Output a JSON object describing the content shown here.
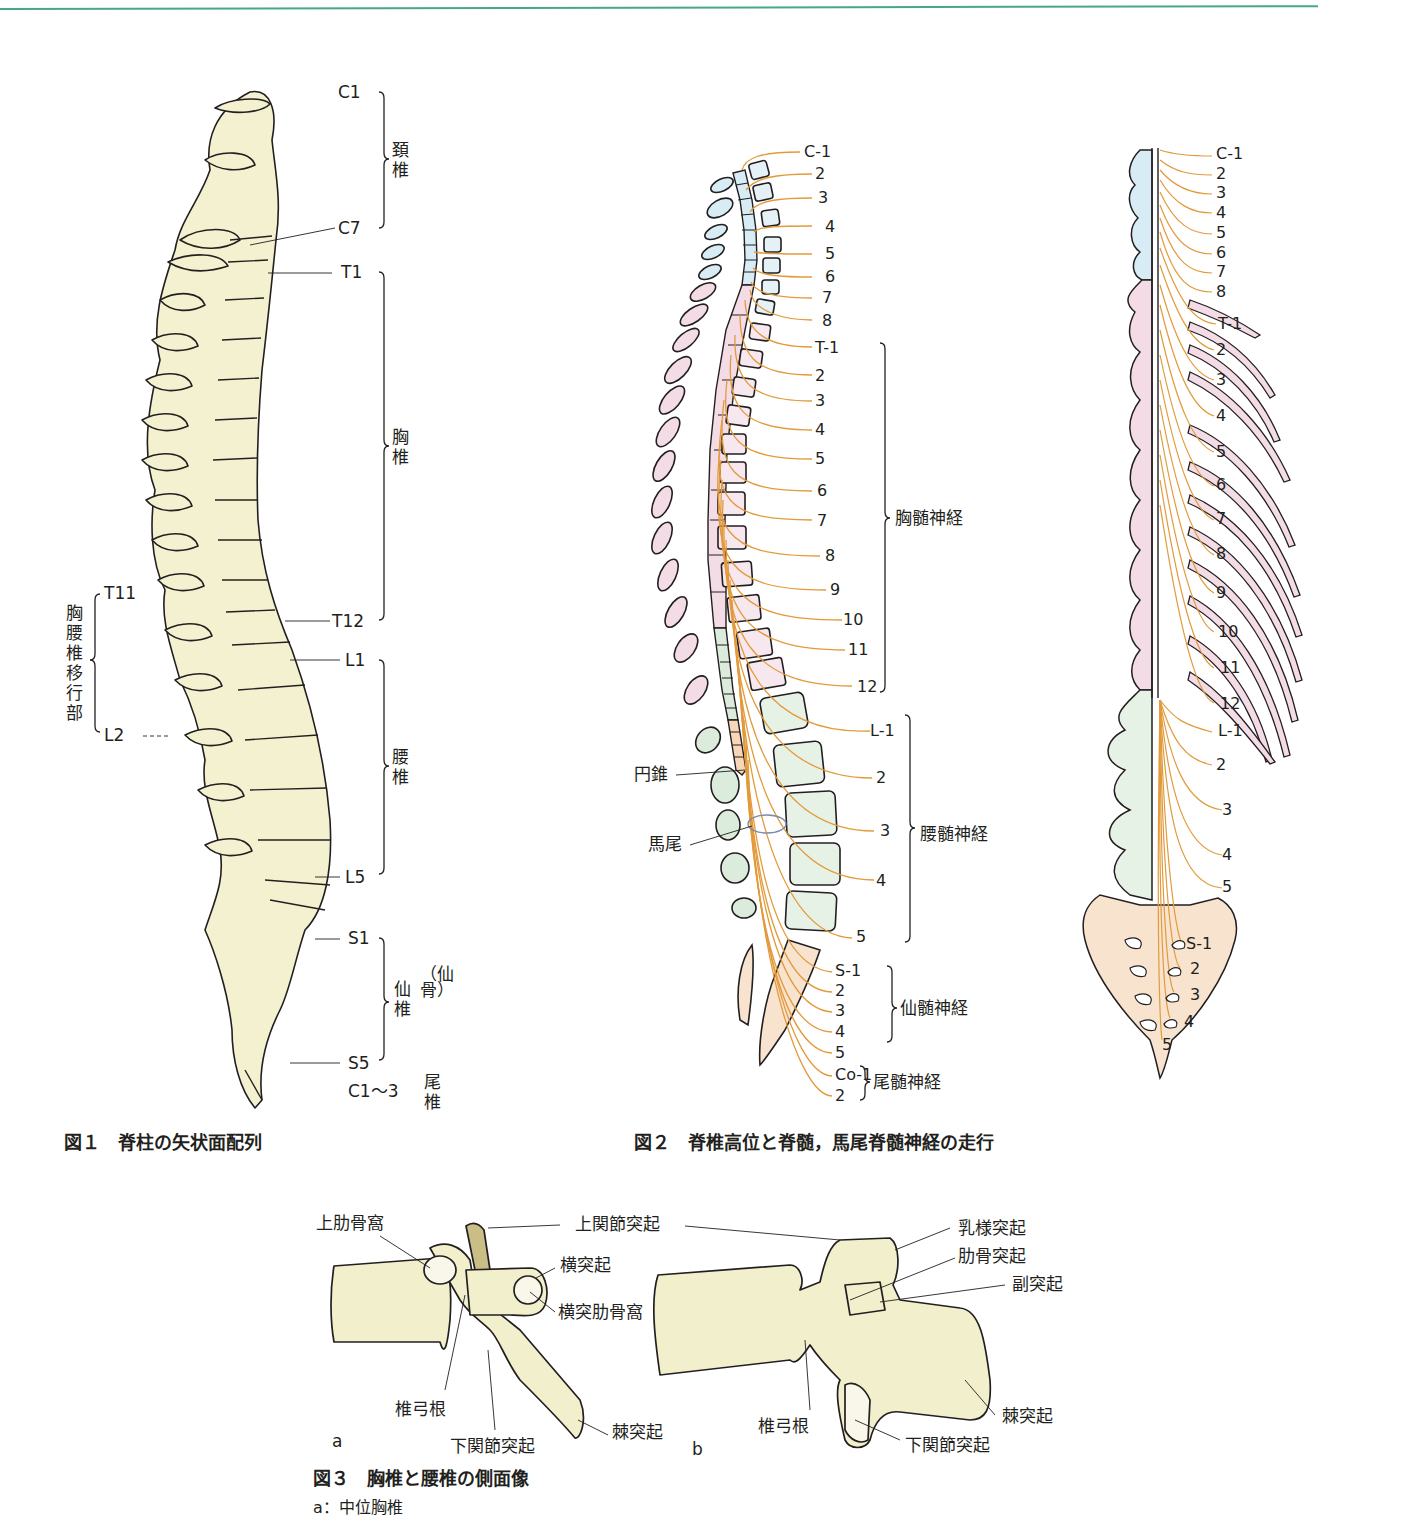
{
  "colors": {
    "bone_fill": "#f3f1cf",
    "cervical": "#d7ecf5",
    "thoracic": "#f3dce6",
    "lumbar": "#dcecdc",
    "sacral": "#f8e3cf",
    "nerve": "#e39a3b",
    "top_rule": "#4aa783"
  },
  "fig1": {
    "caption": "図１　脊柱の矢状面配列",
    "labels": {
      "c1": "C1",
      "c7": "C7",
      "t1": "T1",
      "t12": "T12",
      "l1": "L1",
      "l5": "L5",
      "s1": "S1",
      "s5": "S5",
      "coccyx": "C1～3",
      "t11": "T11",
      "l2": "L2"
    },
    "regions": {
      "cervical": "頚椎",
      "thoracic": "胸椎",
      "lumbar": "腰椎",
      "sacral": "仙椎",
      "sacrum": "（仙骨）",
      "coccygeal": "尾椎",
      "transition": "胸腰椎移行部"
    }
  },
  "fig2": {
    "caption": "図２　脊椎高位と脊髄，馬尾脊髄神経の走行",
    "cervical_nerves": [
      "C-1",
      "2",
      "3",
      "4",
      "5",
      "6",
      "7",
      "8"
    ],
    "thoracic_nerves": [
      "T-1",
      "2",
      "3",
      "4",
      "5",
      "6",
      "7",
      "8",
      "9",
      "10",
      "11",
      "12"
    ],
    "lumbar_nerves": [
      "L-1",
      "2",
      "3",
      "4",
      "5"
    ],
    "sacral_nerves": [
      "S-1",
      "2",
      "3",
      "4",
      "5"
    ],
    "coccygeal_nerves": [
      "Co-1",
      "2"
    ],
    "groups": {
      "thoracic": "胸髄神経",
      "lumbar": "腰髄神経",
      "sacral": "仙髄神経",
      "coccygeal": "尾髄神経"
    },
    "annotations": {
      "conus": "円錐",
      "cauda": "馬尾"
    },
    "posterior_view": {
      "cervical": [
        "C-1",
        "2",
        "3",
        "4",
        "5",
        "6",
        "7",
        "8"
      ],
      "thoracic": [
        "T-1",
        "2",
        "3",
        "4",
        "5",
        "6",
        "7",
        "8",
        "9",
        "10",
        "11",
        "12"
      ],
      "lumbar": [
        "L-1",
        "2",
        "3",
        "4",
        "5"
      ],
      "sacral": [
        "S-1",
        "2",
        "3",
        "4",
        "5"
      ]
    }
  },
  "fig3": {
    "caption": "図３　胸椎と腰椎の側面像",
    "subcaption": "a：中位胸椎",
    "panel_a": "a",
    "panel_b": "b",
    "labels_a": {
      "sup_costal_fovea": "上肋骨窩",
      "sup_articular": "上関節突起",
      "transverse": "横突起",
      "transverse_costal_fovea": "横突肋骨窩",
      "pedicle": "椎弓根",
      "inf_articular": "下関節突起",
      "spinous": "棘突起"
    },
    "labels_b": {
      "mammillary": "乳様突起",
      "costal_process": "肋骨突起",
      "accessory": "副突起",
      "pedicle": "椎弓根",
      "inf_articular": "下関節突起",
      "spinous": "棘突起"
    }
  }
}
